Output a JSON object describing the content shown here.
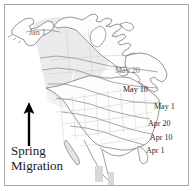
{
  "figure": {
    "type": "map",
    "background_color": "#ffffff",
    "frame_color": "#a8a8a8",
    "land_outline_color": "#6b6b6b",
    "state_border_color": "#c9c9c9",
    "isoline_color": "#8e8e8e",
    "shaded_region_color": "#ebebeb",
    "arrow_color": "#000000",
    "label_color": "#2a2a2a"
  },
  "legend": {
    "line1": "Spring",
    "line2": "Migration",
    "arrow_direction": "up",
    "arrow_name": "northward-migration-arrow"
  },
  "isochrones": [
    {
      "label": "Jan 1",
      "x": 29,
      "y": 28,
      "faint": true,
      "name": "isochrone-label-jan-1"
    },
    {
      "label": "May 20",
      "x": 115,
      "y": 66,
      "faint": true,
      "name": "isochrone-label-may-20"
    },
    {
      "label": "May 10",
      "x": 123,
      "y": 85,
      "faint": false,
      "name": "isochrone-label-may-10"
    },
    {
      "label": "May 1",
      "x": 154,
      "y": 102,
      "faint": false,
      "name": "isochrone-label-may-1"
    },
    {
      "label": "Apr 20",
      "x": 148,
      "y": 119,
      "faint": false,
      "name": "isochrone-label-apr-20"
    },
    {
      "label": "Apr 10",
      "x": 150,
      "y": 133,
      "faint": false,
      "name": "isochrone-label-apr-10"
    },
    {
      "label": "Apr 1",
      "x": 146,
      "y": 146,
      "faint": false,
      "name": "isochrone-label-apr-1"
    }
  ]
}
